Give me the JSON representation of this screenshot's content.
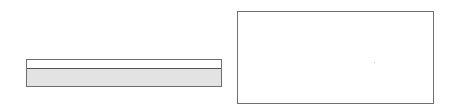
{
  "left_widget": {
    "top_strip_text": "",
    "bottom_area_text": "",
    "colors": {
      "border": "#6e6e6e",
      "divider": "#555555",
      "top_fill": "#ffffff",
      "bottom_fill": "#e3e3e3"
    }
  },
  "right_panel": {
    "content_text": "",
    "colors": {
      "border": "#707070",
      "fill": "#ffffff"
    }
  }
}
